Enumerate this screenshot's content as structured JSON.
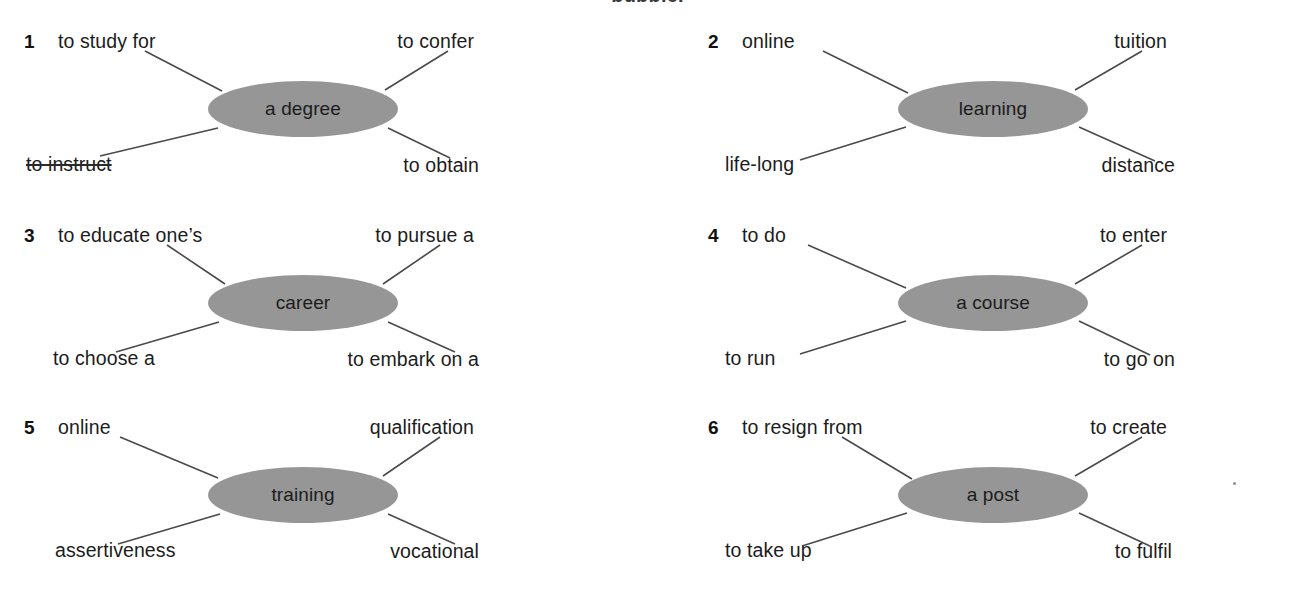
{
  "page": {
    "clipped_heading": "bubble.",
    "background_color": "#ffffff",
    "ellipse_fill": "#969696",
    "line_color": "#4a4a4a"
  },
  "bubbles": [
    {
      "number": "1",
      "center": "a degree",
      "top_left": "to study for",
      "top_right": "to confer",
      "bottom_left": "to instruct",
      "bottom_left_struck": true,
      "bottom_right": "to obtain"
    },
    {
      "number": "2",
      "center": "learning",
      "top_left": "online",
      "top_right": "tuition",
      "bottom_left": "life-long",
      "bottom_left_struck": false,
      "bottom_right": "distance"
    },
    {
      "number": "3",
      "center": "career",
      "top_left": "to educate one’s",
      "top_right": "to pursue a",
      "bottom_left": "to choose a",
      "bottom_left_struck": false,
      "bottom_right": "to embark on a"
    },
    {
      "number": "4",
      "center": "a course",
      "top_left": "to do",
      "top_right": "to enter",
      "bottom_left": "to run",
      "bottom_left_struck": false,
      "bottom_right": "to go on"
    },
    {
      "number": "5",
      "center": "training",
      "top_left": "online",
      "top_right": "qualification",
      "bottom_left": "assertiveness",
      "bottom_left_struck": false,
      "bottom_right": "vocational"
    },
    {
      "number": "6",
      "center": "a post",
      "top_left": "to resign from",
      "top_right": "to create",
      "bottom_left": "to take up",
      "bottom_left_struck": false,
      "bottom_right": "to fulfil"
    }
  ]
}
